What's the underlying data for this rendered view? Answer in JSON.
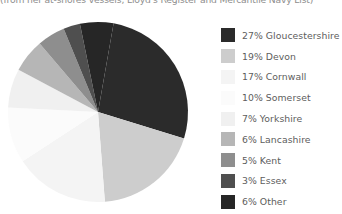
{
  "caption": {
    "text": "(from her at-shores vessels, Lloyd's Register and Mercantile Navy List)"
  },
  "legend": {
    "items": [
      {
        "label": "27% Gloucestershire",
        "color": "#2b2b2b"
      },
      {
        "label": "19% Devon",
        "color": "#cdcdcd"
      },
      {
        "label": "17% Cornwall",
        "color": "#f4f4f4"
      },
      {
        "label": "10% Somerset",
        "color": "#fbfbfb"
      },
      {
        "label": "7% Yorkshire",
        "color": "#f0f0f0"
      },
      {
        "label": "6% Lancashire",
        "color": "#b6b6b6"
      },
      {
        "label": "5% Kent",
        "color": "#8e8e8e"
      },
      {
        "label": "3% Essex",
        "color": "#4f4f4f"
      },
      {
        "label": "6% Other",
        "color": "#262626"
      }
    ]
  },
  "chart_data": {
    "type": "pie",
    "title": "",
    "subtitle": "(from her at-shores vessels, Lloyd's Register and Mercantile Navy List)",
    "legend_position": "right",
    "grid": false,
    "start_angle_deg": -80,
    "direction": "clockwise",
    "center": {
      "x": 98,
      "y": 104
    },
    "radius": 90,
    "categories": [
      "Gloucestershire",
      "Devon",
      "Cornwall",
      "Somerset",
      "Yorkshire",
      "Lancashire",
      "Kent",
      "Essex",
      "Other"
    ],
    "values": [
      27,
      19,
      17,
      10,
      7,
      6,
      5,
      3,
      6
    ],
    "unit": "%",
    "colors": [
      "#2b2b2b",
      "#cdcdcd",
      "#f4f4f4",
      "#fbfbfb",
      "#f0f0f0",
      "#b6b6b6",
      "#8e8e8e",
      "#4f4f4f",
      "#262626"
    ],
    "labels": [
      "27% Gloucestershire",
      "19% Devon",
      "17% Cornwall",
      "10% Somerset",
      "7% Yorkshire",
      "6% Lancashire",
      "5% Kent",
      "3% Essex",
      "6% Other"
    ]
  }
}
